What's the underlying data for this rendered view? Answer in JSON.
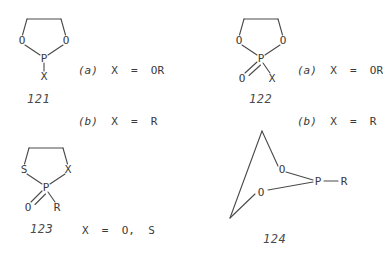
{
  "page": {
    "background_color": "#ffffff",
    "line_color": "#4a4a4a",
    "text_color": "#3a3a3a"
  },
  "structures": [
    {
      "id": "121",
      "number_label": "121",
      "description": "1,3,2-dioxaphospholane",
      "atoms": {
        "o_left": "O",
        "o_right": "O",
        "p": "P",
        "x_down": "X"
      },
      "legend": [
        {
          "tag": "(a)",
          "text": "X  =  OR"
        },
        {
          "tag": "(b)",
          "text": "X  =  R"
        }
      ]
    },
    {
      "id": "122",
      "number_label": "122",
      "description": "2-oxo-1,3,2-dioxaphospholane",
      "atoms": {
        "o_left": "O",
        "o_right": "O",
        "p": "P",
        "o_double": "O",
        "x_down": "X"
      },
      "legend": [
        {
          "tag": "(a)",
          "text": "X  =  OR"
        },
        {
          "tag": "(b)",
          "text": "X  =  R"
        }
      ]
    },
    {
      "id": "123",
      "number_label": "123",
      "description": "2-oxo-1,3,2-thiaphospholane",
      "atoms": {
        "s_left": "S",
        "x_right": "X",
        "p": "P",
        "o_double": "O",
        "r_down": "R"
      },
      "legend": [
        {
          "tag": "",
          "text": "X  =  O,  S"
        }
      ]
    },
    {
      "id": "124",
      "number_label": "124",
      "description": "bicyclic phosphite cage",
      "atoms": {
        "o_upper": "O",
        "o_lower": "O",
        "p": "P",
        "r_right": "R"
      },
      "legend": []
    }
  ]
}
